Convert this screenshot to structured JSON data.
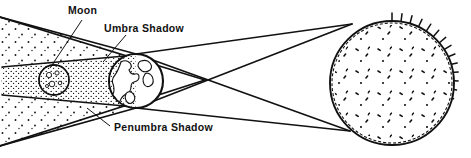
{
  "figure": {
    "type": "astronomy-diagram",
    "background_color": "#ffffff",
    "ink_color": "#111111",
    "width": 471,
    "height": 158
  },
  "labels": {
    "moon": "Moon",
    "umbra": "Umbra Shadow",
    "penumbra": "Penumbra Shadow"
  },
  "bodies": {
    "moon": {
      "name": "Moon",
      "cx": 54,
      "cy": 80,
      "r": 15,
      "texture": "craters"
    },
    "earth": {
      "name": "Earth",
      "cx": 136,
      "cy": 81,
      "r": 27,
      "texture": "continents"
    },
    "sun": {
      "name": "Sun",
      "cx": 392,
      "cy": 83,
      "r": 62,
      "texture": "spiky-corona-and-sunspots"
    }
  },
  "shadow_regions": {
    "umbra": {
      "name": "Umbra Shadow",
      "stipple_density": "dense",
      "shape": "cone-from-earth-to-left-past-moon"
    },
    "penumbra": {
      "name": "Penumbra Shadow",
      "stipple_density": "sparse",
      "shape": "wide-wedge-expanding-to-left"
    }
  },
  "rays": {
    "count": 4,
    "description": "tangent-lines-from-sun-limbs-past-earth",
    "sun_top_tangent": [
      352,
      24
    ],
    "sun_bottom_tangent": [
      350,
      131
    ],
    "earth_top_tangent": [
      136,
      54
    ],
    "earth_bottom_tangent": [
      136,
      108
    ],
    "crossing_point": [
      205,
      80
    ]
  },
  "leaders": [
    {
      "label": "Moon",
      "from": [
        82,
        20
      ],
      "to": [
        50,
        68
      ]
    },
    {
      "label": "Umbra Shadow",
      "from": [
        126,
        35
      ],
      "to": [
        103,
        62
      ]
    },
    {
      "label": "Penumbra Shadow",
      "from": [
        110,
        126
      ],
      "to": [
        87,
        108
      ]
    }
  ],
  "label_positions": {
    "moon": [
      68,
      14
    ],
    "umbra": [
      104,
      32
    ],
    "penumbra": [
      114,
      131
    ]
  }
}
